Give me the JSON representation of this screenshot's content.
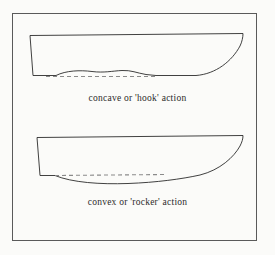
{
  "figure": {
    "background_color": "#fbfbf9",
    "frame": {
      "name": "figure-border",
      "stroke_color": "#5a5a5a",
      "x": 12.5,
      "y": 13.5,
      "width": 244,
      "height": 227
    },
    "line_color": "#2b2b2b",
    "dash_color": "#8a8a8a"
  },
  "diagrams": [
    {
      "id": "hook",
      "caption": "concave or 'hook' action",
      "profile_type": "concave",
      "deck_line": {
        "x1": 30,
        "y1": 35.5,
        "x2": 243,
        "y2": 33.5
      },
      "transom_line": {
        "x1": 30,
        "y1": 35.5,
        "x2": 33,
        "y2": 75.5
      },
      "keel_path": "M 33 75.5 L 56 75.5 C 66 70.5 80 70 92 71.5 C 104 73 112 71 122 70.5 C 131 70 137 73 146 74.5 L 156 75.5 L 196 75.5 C 216 74 232 61 240 46 C 242 42 243 37 243 33.5",
      "reference_dash": {
        "x1": 46,
        "y1": 76.5,
        "x2": 156,
        "y2": 76.5
      }
    },
    {
      "id": "rocker",
      "caption": "convex or 'rocker' action",
      "profile_type": "convex",
      "deck_line": {
        "x1": 37,
        "y1": 137.5,
        "x2": 243,
        "y2": 135.5
      },
      "transom_line": {
        "x1": 37,
        "y1": 137.5,
        "x2": 40,
        "y2": 175.5
      },
      "keel_path": "M 40 175.5 L 55 175.5 C 72 182.5 100 184.5 128 183.5 C 156 182.5 182 179 200 175 C 220 170 234 157 240 146 C 242 142 243 139 243 135.5",
      "reference_dash": {
        "x1": 55,
        "y1": 175.5,
        "x2": 166,
        "y2": 174.5
      }
    }
  ]
}
